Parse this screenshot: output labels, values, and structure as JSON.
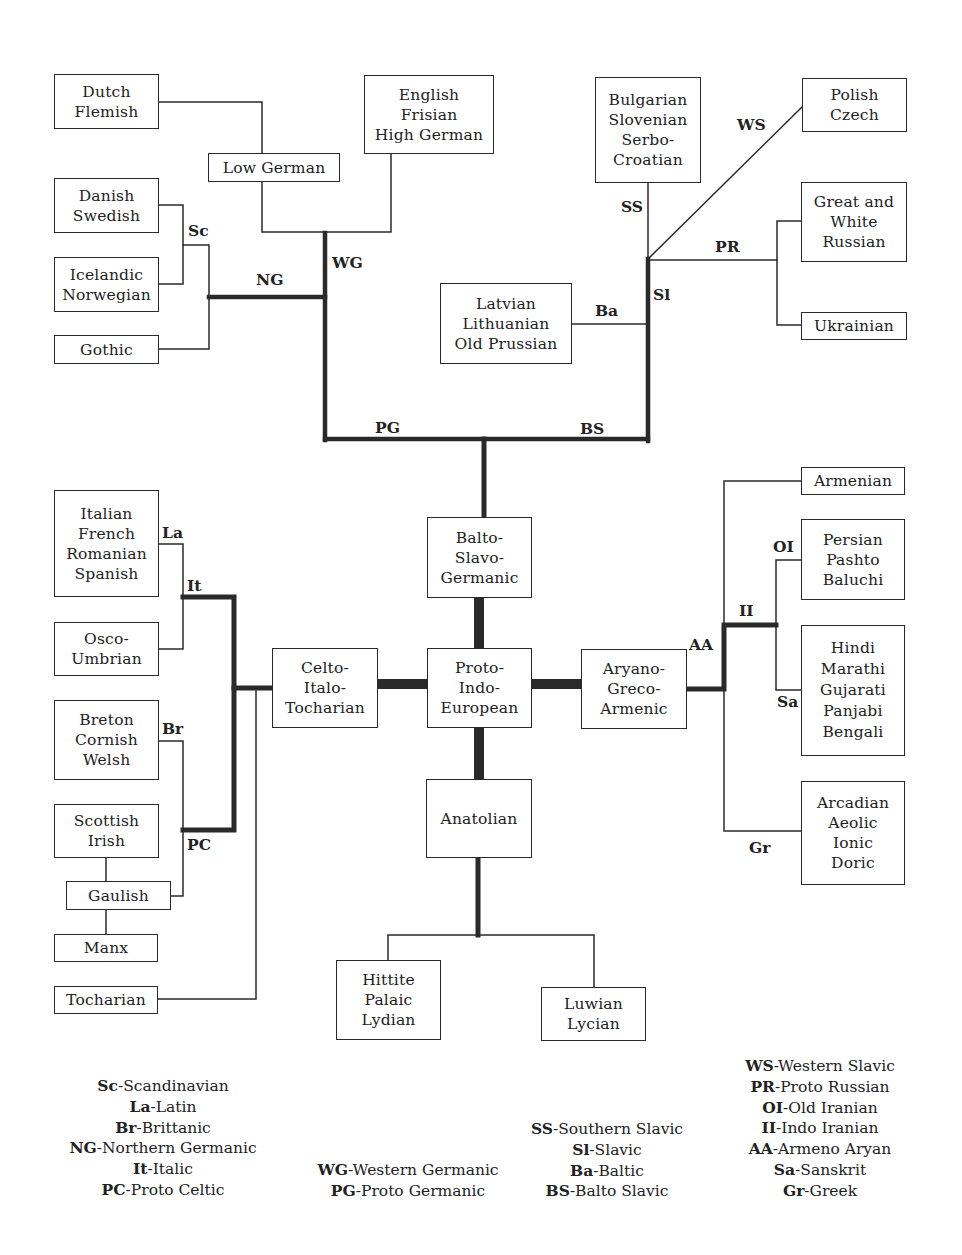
{
  "diagram": {
    "title": "",
    "nodes": {
      "dutch": [
        "Dutch",
        "Flemish"
      ],
      "english": [
        "English",
        "Frisian",
        "High German"
      ],
      "low_german": [
        "Low German"
      ],
      "danish": [
        "Danish",
        "Swedish"
      ],
      "icelandic": [
        "Icelandic",
        "Norwegian"
      ],
      "gothic": [
        "Gothic"
      ],
      "bulgarian": [
        "Bulgarian",
        "Slovenian",
        "Serbo-",
        "Croatian"
      ],
      "polish": [
        "Polish",
        "Czech"
      ],
      "great_white": [
        "Great and",
        "White",
        "Russian"
      ],
      "ukrainian": [
        "Ukrainian"
      ],
      "latvian": [
        "Latvian",
        "Lithuanian",
        "Old Prussian"
      ],
      "italian": [
        "Italian",
        "French",
        "Romanian",
        "Spanish"
      ],
      "osco": [
        "Osco-",
        "Umbrian"
      ],
      "breton": [
        "Breton",
        "Cornish",
        "Welsh"
      ],
      "scottish": [
        "Scottish",
        "Irish"
      ],
      "gaulish": [
        "Gaulish"
      ],
      "manx": [
        "Manx"
      ],
      "tocharian": [
        "Tocharian"
      ],
      "celto": [
        "Celto-",
        "Italo-",
        "Tocharian"
      ],
      "balto": [
        "Balto-",
        "Slavo-",
        "Germanic"
      ],
      "pie": [
        "Proto-",
        "Indo-",
        "European"
      ],
      "aryano": [
        "Aryano-",
        "Greco-",
        "Armenic"
      ],
      "armenian": [
        "Armenian"
      ],
      "persian": [
        "Persian",
        "Pashto",
        "Baluchi"
      ],
      "hindi": [
        "Hindi",
        "Marathi",
        "Gujarati",
        "Panjabi",
        "Bengali"
      ],
      "greek": [
        "Arcadian",
        "Aeolic",
        "Ionic",
        "Doric"
      ],
      "anatolian": [
        "Anatolian"
      ],
      "hittite": [
        "Hittite",
        "Palaic",
        "Lydian"
      ],
      "luwian": [
        "Luwian",
        "Lycian"
      ]
    },
    "branch_labels": {
      "sc": "Sc",
      "ng": "NG",
      "wg": "WG",
      "pg": "PG",
      "bs": "BS",
      "ss": "SS",
      "ws": "WS",
      "pr": "PR",
      "sl": "Sl",
      "ba": "Ba",
      "la": "La",
      "it": "It",
      "br": "Br",
      "pc": "PC",
      "oi": "OI",
      "ii": "II",
      "aa": "AA",
      "sa": "Sa",
      "gr": "Gr"
    }
  },
  "legend": {
    "col1": [
      {
        "abbr": "Sc",
        "text": "-Scandinavian"
      },
      {
        "abbr": "La",
        "text": "-Latin"
      },
      {
        "abbr": "Br",
        "text": "-Brittanic"
      },
      {
        "abbr": "NG",
        "text": "-Northern Germanic"
      },
      {
        "abbr": "It",
        "text": "-Italic"
      },
      {
        "abbr": "PC",
        "text": "-Proto Celtic"
      }
    ],
    "col2": [
      {
        "abbr": "WG",
        "text": "-Western Germanic"
      },
      {
        "abbr": "PG",
        "text": "-Proto Germanic"
      }
    ],
    "col3": [
      {
        "abbr": "SS",
        "text": "-Southern Slavic"
      },
      {
        "abbr": "Sl",
        "text": "-Slavic"
      },
      {
        "abbr": "Ba",
        "text": "-Baltic"
      },
      {
        "abbr": "BS",
        "text": "-Balto Slavic"
      }
    ],
    "col4": [
      {
        "abbr": "WS",
        "text": "-Western Slavic"
      },
      {
        "abbr": "PR",
        "text": "-Proto Russian"
      },
      {
        "abbr": "OI",
        "text": "-Old Iranian"
      },
      {
        "abbr": "II",
        "text": "-Indo Iranian"
      },
      {
        "abbr": "AA",
        "text": "-Armeno Aryan"
      },
      {
        "abbr": "Sa",
        "text": "-Sanskrit"
      },
      {
        "abbr": "Gr",
        "text": "-Greek"
      }
    ]
  },
  "colors": {
    "ink": "#222222",
    "background": "#ffffff"
  }
}
